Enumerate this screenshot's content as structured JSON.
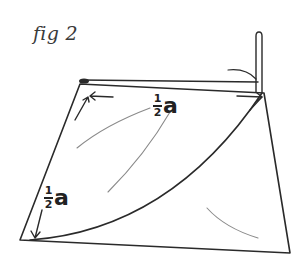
{
  "figure": {
    "title": "fig 2",
    "type": "hand-drawn geometric sketch",
    "stroke_color": "#2a2a2a",
    "faint_stroke_color": "#8a8a8a"
  },
  "labels": {
    "top": {
      "numerator": "1",
      "denominator": "2",
      "variable": "a"
    },
    "left": {
      "numerator": "1",
      "denominator": "2",
      "variable": "a"
    }
  },
  "shapes": {
    "quadrilateral": [
      [
        80,
        83
      ],
      [
        264,
        92
      ],
      [
        290,
        253
      ],
      [
        20,
        240
      ]
    ],
    "top_double_line": [
      [
        82,
        80
      ],
      [
        258,
        82
      ]
    ],
    "pole": {
      "x": 259,
      "top": 33,
      "bottom": 92,
      "width": 6
    },
    "arc": {
      "from": [
        30,
        240
      ],
      "to": [
        262,
        93
      ]
    }
  }
}
